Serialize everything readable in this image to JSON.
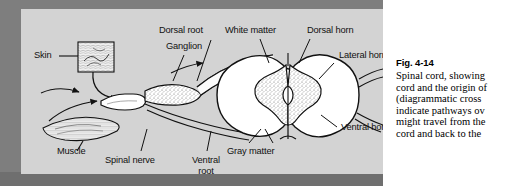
{
  "figure": {
    "panel_bg": "#d3d3d3",
    "shadow_color": "#7e7e7e",
    "labels": {
      "skin": "Skin",
      "muscle": "Muscle",
      "dorsal_root": "Dorsal root",
      "ganglion": "Ganglion",
      "white_matter": "White matter",
      "dorsal_horn": "Dorsal horn",
      "lateral_horn": "Lateral horn",
      "ventral_horn": "Ventral horn",
      "gray_matter": "Gray matter",
      "spinal_nerve": "Spinal nerve",
      "ventral_root_line1": "Ventral",
      "ventral_root_line2": "root"
    }
  },
  "caption": {
    "fig_number": "Fig. 4-14",
    "lines": [
      "Spinal cord, showing",
      "cord and the origin of",
      "(diagrammatic cross",
      "indicate pathways ov",
      "might travel from the",
      "cord and back to the"
    ]
  }
}
